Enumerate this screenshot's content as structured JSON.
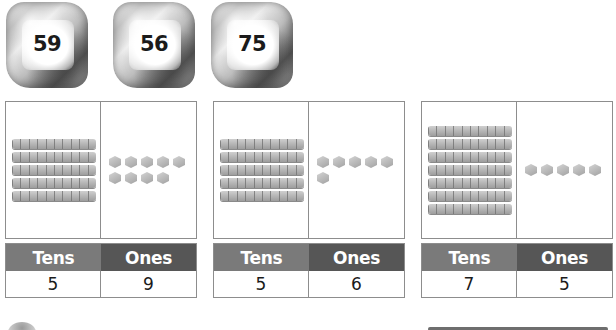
{
  "ice_cubes": [
    {
      "number": "59"
    },
    {
      "number": "56"
    },
    {
      "number": "75"
    }
  ],
  "place_value_charts": [
    {
      "tens_label": "Tens",
      "ones_label": "Ones",
      "tens_value": "5",
      "ones_value": "9",
      "tens_rods": 5,
      "ones_units": 9
    },
    {
      "tens_label": "Tens",
      "ones_label": "Ones",
      "tens_value": "5",
      "ones_value": "6",
      "tens_rods": 5,
      "ones_units": 6
    },
    {
      "tens_label": "Tens",
      "ones_label": "Ones",
      "tens_value": "7",
      "ones_value": "5",
      "tens_rods": 7,
      "ones_units": 5
    }
  ],
  "colors": {
    "tens_header": "#7a7a7a",
    "ones_header": "#565656",
    "border": "#8d8d8d",
    "block": "#b8b8b8"
  }
}
